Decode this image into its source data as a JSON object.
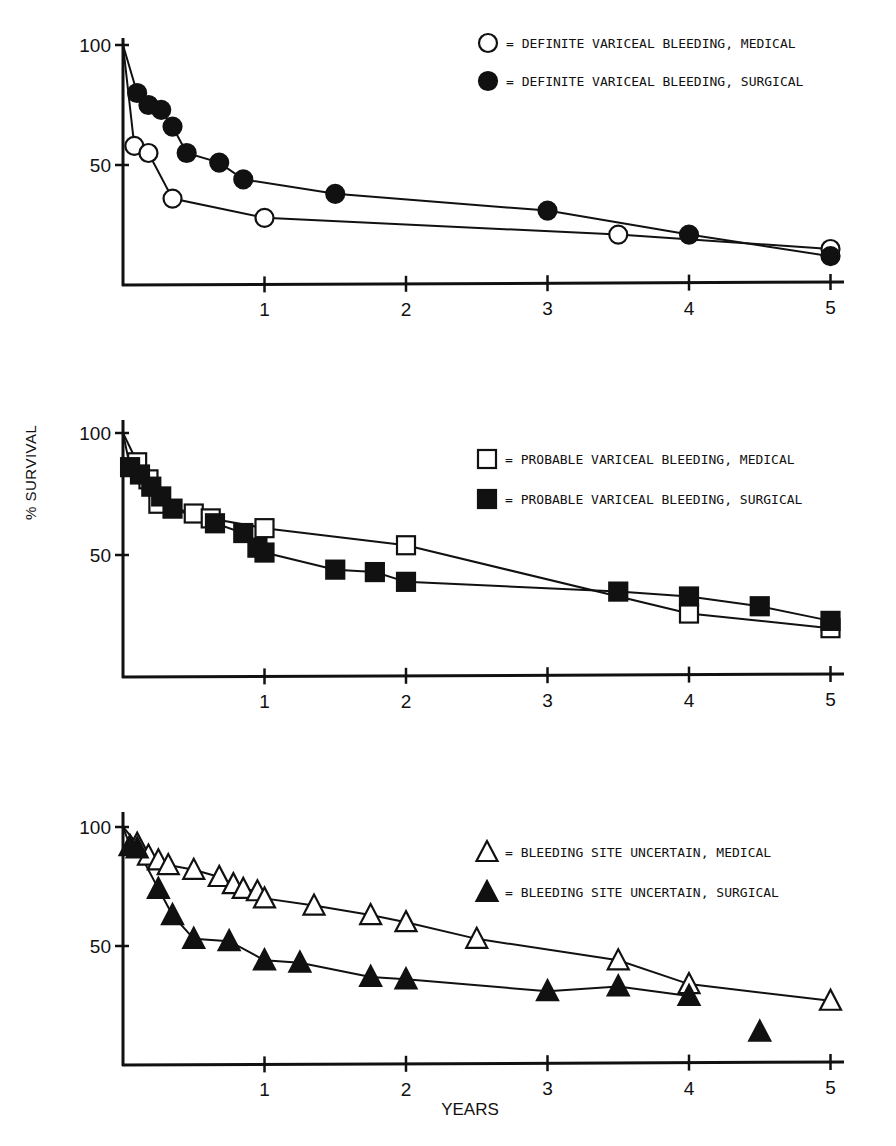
{
  "figure": {
    "ylabel": "% SURVIVAL",
    "xlabel": "YEARS"
  },
  "chart_data": [
    {
      "type": "line",
      "title": "",
      "xlabel": "",
      "ylabel": "% SURVIVAL",
      "xlim": [
        0,
        5
      ],
      "ylim": [
        0,
        100
      ],
      "xticks": [
        "1",
        "2",
        "3",
        "4",
        "5"
      ],
      "yticks": [
        "50",
        "100"
      ],
      "grid": false,
      "legend_position": "upper right",
      "series": [
        {
          "name": "DEFINITE VARICEAL BLEEDING, MEDICAL",
          "marker": "open-circle",
          "x": [
            0,
            0.08,
            0.18,
            0.35,
            1,
            3.5,
            5
          ],
          "y": [
            100,
            58,
            55,
            36,
            28,
            21,
            15
          ]
        },
        {
          "name": "DEFINITE VARICEAL BLEEDING, SURGICAL",
          "marker": "filled-circle",
          "x": [
            0,
            0.1,
            0.18,
            0.27,
            0.35,
            0.45,
            0.68,
            0.85,
            1.5,
            3,
            4,
            5
          ],
          "y": [
            100,
            80,
            75,
            73,
            66,
            55,
            51,
            44,
            38,
            31,
            21,
            12
          ]
        }
      ]
    },
    {
      "type": "line",
      "title": "",
      "xlabel": "",
      "ylabel": "% SURVIVAL",
      "xlim": [
        0,
        5
      ],
      "ylim": [
        0,
        100
      ],
      "xticks": [
        "1",
        "2",
        "3",
        "4",
        "5"
      ],
      "yticks": [
        "50",
        "100"
      ],
      "grid": false,
      "legend_position": "upper right",
      "series": [
        {
          "name": "PROBABLE VARICEAL BLEEDING, MEDICAL",
          "marker": "open-square",
          "x": [
            0,
            0.1,
            0.18,
            0.25,
            0.5,
            0.62,
            1,
            2,
            4,
            5
          ],
          "y": [
            100,
            88,
            81,
            71,
            67,
            65,
            61,
            54,
            26,
            20
          ]
        },
        {
          "name": "PROBABLE VARICEAL BLEEDING, SURGICAL",
          "marker": "filled-square",
          "x": [
            0,
            0.05,
            0.12,
            0.2,
            0.27,
            0.35,
            0.65,
            0.85,
            0.95,
            1,
            1.5,
            1.78,
            2,
            3.5,
            4,
            4.5,
            5
          ],
          "y": [
            100,
            86,
            83,
            78,
            74,
            69,
            63,
            59,
            53,
            51,
            44,
            43,
            39,
            35,
            33,
            29,
            23
          ]
        }
      ]
    },
    {
      "type": "line",
      "title": "",
      "xlabel": "YEARS",
      "ylabel": "% SURVIVAL",
      "xlim": [
        0,
        5
      ],
      "ylim": [
        0,
        100
      ],
      "xticks": [
        "1",
        "2",
        "3",
        "4",
        "5"
      ],
      "yticks": [
        "50",
        "100"
      ],
      "grid": false,
      "legend_position": "upper right",
      "series": [
        {
          "name": "BLEEDING SITE UNCERTAIN, MEDICAL",
          "marker": "open-triangle",
          "x": [
            0,
            0.1,
            0.18,
            0.25,
            0.32,
            0.5,
            0.68,
            0.78,
            0.85,
            0.95,
            1,
            1.35,
            1.75,
            2,
            2.5,
            3.5,
            4,
            5
          ],
          "y": [
            100,
            93,
            88,
            86,
            84,
            82,
            79,
            76,
            74,
            73,
            70,
            67,
            63,
            60,
            53,
            44,
            34,
            27
          ]
        },
        {
          "name": "BLEEDING SITE UNCERTAIN, SURGICAL",
          "marker": "filled-triangle",
          "x": [
            0,
            0.05,
            0.1,
            0.25,
            0.35,
            0.5,
            0.75,
            1,
            1.25,
            1.75,
            2,
            3,
            3.5,
            4
          ],
          "y": [
            100,
            92,
            91,
            74,
            63,
            53,
            52,
            44,
            43,
            37,
            36,
            31,
            33,
            29
          ],
          "unconnected_points": [
            {
              "x": 4.5,
              "y": 14
            }
          ]
        }
      ]
    }
  ]
}
